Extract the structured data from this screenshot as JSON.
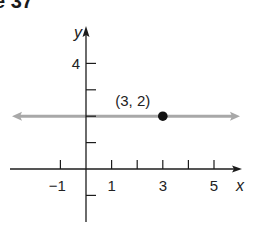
{
  "figure_label": "e 37",
  "chart_data": {
    "type": "line",
    "title": "",
    "xlabel": "x",
    "ylabel": "y",
    "xlim": [
      -3,
      6
    ],
    "ylim": [
      -1.5,
      5
    ],
    "x_ticks": [
      -1,
      0,
      1,
      2,
      3,
      4,
      5
    ],
    "x_tick_labels": [
      {
        "value": -1,
        "label": "−1"
      },
      {
        "value": 1,
        "label": "1"
      },
      {
        "value": 3,
        "label": "3"
      },
      {
        "value": 5,
        "label": "5"
      }
    ],
    "y_ticks": [
      -1,
      1,
      2,
      3,
      4
    ],
    "y_tick_labels": [
      {
        "value": 4,
        "label": "4"
      }
    ],
    "series": [
      {
        "name": "y = 2",
        "kind": "horizontal-line",
        "y": 2,
        "color": "#a8a8a8",
        "arrows": "both"
      }
    ],
    "points": [
      {
        "x": 3,
        "y": 2,
        "label": "(3, 2)",
        "color": "#111111"
      }
    ],
    "grid": false,
    "legend": "none"
  }
}
